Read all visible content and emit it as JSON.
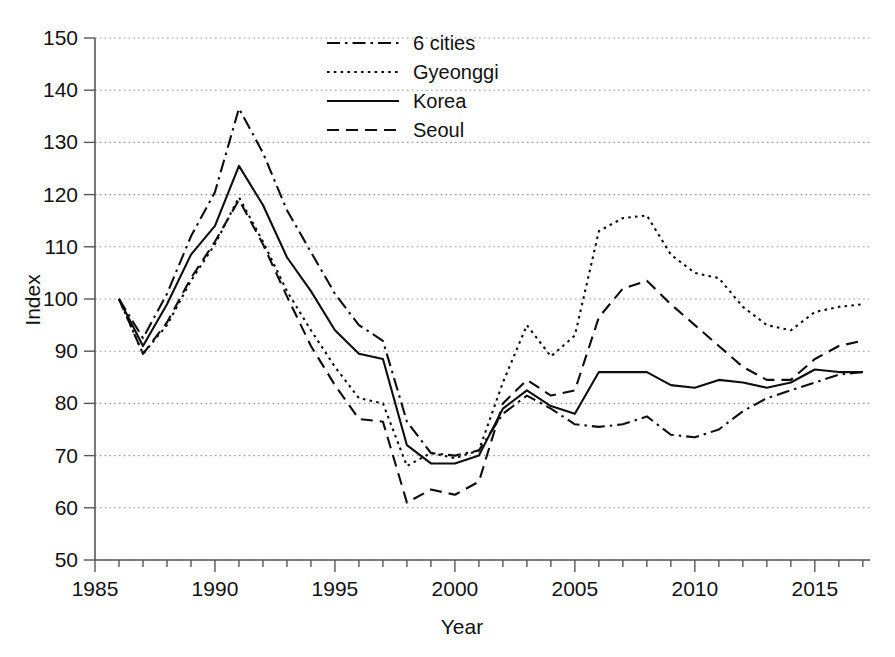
{
  "chart_data": {
    "type": "line",
    "title": "",
    "xlabel": "Year",
    "ylabel": "Index",
    "xlim": [
      1985,
      2017.3
    ],
    "ylim": [
      50,
      150
    ],
    "ytick_step": 10,
    "xtick_step": 5,
    "x_minor_tick_step": 1,
    "grid": true,
    "grid_axis": "y",
    "legend_position": "top-center",
    "x": [
      1986,
      1987,
      1988,
      1989,
      1990,
      1991,
      1992,
      1993,
      1994,
      1995,
      1996,
      1997,
      1998,
      1999,
      2000,
      2001,
      2002,
      2003,
      2004,
      2005,
      2006,
      2007,
      2008,
      2009,
      2010,
      2011,
      2012,
      2013,
      2014,
      2015,
      2016,
      2017
    ],
    "x_tick_labels": [
      "1985",
      "1990",
      "1995",
      "2000",
      "2005",
      "2010",
      "2015"
    ],
    "y_tick_labels": [
      "50",
      "60",
      "70",
      "80",
      "90",
      "100",
      "110",
      "120",
      "130",
      "140",
      "150"
    ],
    "series": [
      {
        "name": "6 cities",
        "style": "dash-dot",
        "values": [
          100.0,
          92.5,
          101.0,
          112.0,
          120.5,
          136.5,
          128.0,
          117.0,
          109.0,
          101.0,
          95.0,
          92.0,
          76.5,
          70.5,
          70.0,
          71.0,
          78.0,
          81.5,
          79.0,
          76.0,
          75.5,
          76.0,
          77.5,
          74.0,
          73.5,
          75.0,
          78.5,
          81.0,
          82.5,
          84.0,
          85.5,
          86.0
        ]
      },
      {
        "name": "Gyeonggi",
        "style": "dotted",
        "values": [
          100.0,
          89.5,
          95.0,
          103.5,
          110.5,
          119.5,
          111.0,
          101.5,
          94.0,
          87.0,
          81.0,
          80.0,
          68.0,
          70.5,
          69.5,
          71.0,
          84.0,
          95.0,
          89.0,
          93.0,
          113.0,
          115.5,
          116.0,
          108.5,
          105.0,
          104.0,
          98.5,
          95.0,
          94.0,
          97.5,
          98.5,
          99.0
        ]
      },
      {
        "name": "Korea",
        "style": "solid",
        "values": [
          100.0,
          91.0,
          99.0,
          108.5,
          114.0,
          125.5,
          118.0,
          108.0,
          101.5,
          94.0,
          89.5,
          88.5,
          72.0,
          68.5,
          68.5,
          70.0,
          79.0,
          82.5,
          79.5,
          78.0,
          86.0,
          86.0,
          86.0,
          83.5,
          83.0,
          84.5,
          84.0,
          83.0,
          84.0,
          86.5,
          86.0,
          86.0
        ]
      },
      {
        "name": "Seoul",
        "style": "dashed",
        "values": [
          100.0,
          89.5,
          95.5,
          104.0,
          111.0,
          119.0,
          110.5,
          100.5,
          91.0,
          83.5,
          77.0,
          76.5,
          61.0,
          63.5,
          62.5,
          65.0,
          80.0,
          84.5,
          81.5,
          82.5,
          96.5,
          102.0,
          103.5,
          99.0,
          95.0,
          91.0,
          87.0,
          84.5,
          84.5,
          88.5,
          91.0,
          92.0
        ]
      }
    ],
    "legend": [
      {
        "label": "6 cities",
        "style": "dash-dot"
      },
      {
        "label": "Gyeonggi",
        "style": "dotted"
      },
      {
        "label": "Korea",
        "style": "solid"
      },
      {
        "label": "Seoul",
        "style": "dashed"
      }
    ],
    "colors": {
      "line": "#0d0d0d",
      "axis": "#55565a",
      "grid": "#9a9a9a",
      "background": "#ffffff"
    }
  }
}
